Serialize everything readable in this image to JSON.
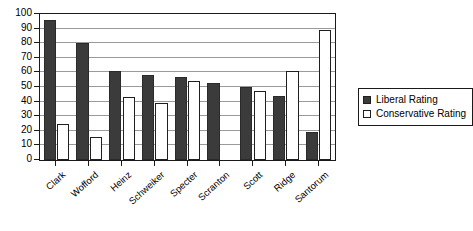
{
  "chart_data": {
    "type": "bar",
    "title": "",
    "xlabel": "",
    "ylabel": "",
    "ylim": [
      0,
      100
    ],
    "ytick_step": 10,
    "yticks": [
      100,
      90,
      80,
      70,
      60,
      50,
      40,
      30,
      20,
      10,
      0
    ],
    "grid": true,
    "legend_position": "right",
    "categories": [
      "Clark",
      "Wofford",
      "Heinz",
      "Schweiker",
      "Specter",
      "Scranton",
      "Scott",
      "Ridge",
      "Santorum"
    ],
    "series": [
      {
        "name": "Liberal Rating",
        "color": "#3b3b3b",
        "values": [
          96,
          80,
          61,
          58,
          57,
          53,
          50,
          44,
          19
        ]
      },
      {
        "name": "Conservative Rating",
        "color": "#ffffff",
        "values": [
          25,
          16,
          43,
          39,
          54,
          0,
          47,
          61,
          89
        ]
      }
    ]
  },
  "legend": {
    "items": [
      {
        "label": "Liberal Rating",
        "swatch": "filled-dark-square"
      },
      {
        "label": "Conservative Rating",
        "swatch": "open-white-square"
      }
    ]
  }
}
